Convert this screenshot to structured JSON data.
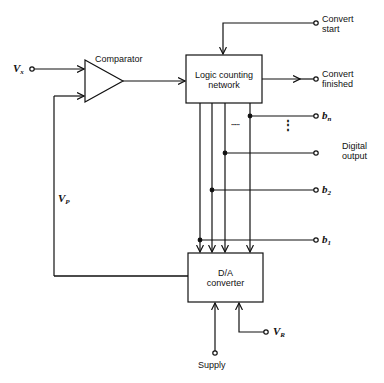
{
  "diagram": {
    "type": "block-diagram",
    "blocks": {
      "comparator": {
        "label": "Comparator"
      },
      "logic": {
        "line1": "Logic counting",
        "line2": "network"
      },
      "dac": {
        "line1": "D/A",
        "line2": "converter"
      }
    },
    "signals": {
      "vx": {
        "main": "V",
        "sub": "x"
      },
      "vp": {
        "main": "V",
        "sub": "P"
      },
      "vr": {
        "main": "V",
        "sub": "R"
      },
      "convert_start": {
        "line1": "Convert",
        "line2": "start"
      },
      "convert_finished": {
        "line1": "Convert",
        "line2": "finished"
      },
      "digital_output": {
        "line1": "Digital",
        "line2": "output"
      },
      "supply": "Supply",
      "bn": {
        "main": "b",
        "sub": "n"
      },
      "b2": {
        "main": "b",
        "sub": "2"
      },
      "b1": {
        "main": "b",
        "sub": "1"
      },
      "ellipsis_h": "·····",
      "ellipsis_v": "⋮"
    },
    "colors": {
      "line": "#111111",
      "background": "#ffffff"
    }
  }
}
